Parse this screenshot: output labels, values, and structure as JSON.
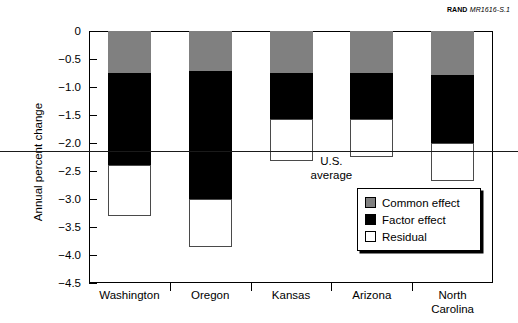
{
  "source_id": {
    "org": "RAND",
    "document": "MR1616-S.1"
  },
  "chart_data": {
    "type": "bar",
    "subtype": "stacked-bar-negative",
    "title": "",
    "xlabel": "",
    "ylabel": "Annual percent change",
    "ylim": [
      -4.5,
      0
    ],
    "ytick_step": 0.5,
    "grid": false,
    "legend_position": "inside-lower-right",
    "categories": [
      "Washington",
      "Oregon",
      "Kansas",
      "Arizona",
      "North\nCarolina"
    ],
    "series": [
      {
        "name": "Common effect",
        "color": "#808080",
        "values": [
          -0.75,
          -0.72,
          -0.75,
          -0.75,
          -0.78
        ]
      },
      {
        "name": "Factor effect",
        "color": "#000000",
        "values": [
          -1.65,
          -2.28,
          -0.82,
          -0.82,
          -1.22
        ]
      },
      {
        "name": "Residual",
        "color": "#ffffff",
        "values": [
          -0.9,
          -0.85,
          -0.76,
          -0.68,
          -0.67
        ]
      }
    ],
    "cumulative_totals": [
      -3.3,
      -3.85,
      -2.33,
      -2.25,
      -2.67
    ],
    "segment_boundaries": {
      "Washington": {
        "common_end": -0.75,
        "factor_end": -2.4,
        "residual_end": -3.3
      },
      "Oregon": {
        "common_end": -0.72,
        "factor_end": -3.0,
        "residual_end": -3.85
      },
      "Kansas": {
        "common_end": -0.75,
        "factor_end": -1.57,
        "residual_end": -2.33
      },
      "Arizona": {
        "common_end": -0.75,
        "factor_end": -1.57,
        "residual_end": -2.25
      },
      "North Carolina": {
        "common_end": -0.78,
        "factor_end": -2.0,
        "residual_end": -2.67
      }
    },
    "ytick_labels": [
      "0",
      "−0.5",
      "−1.0",
      "−1.5",
      "−2.0",
      "−2.5",
      "−3.0",
      "−3.5",
      "−4.0",
      "−4.5"
    ],
    "ytick_values": [
      0,
      -0.5,
      -1.0,
      -1.5,
      -2.0,
      -2.5,
      -3.0,
      -3.5,
      -4.0,
      -4.5
    ],
    "reference_line": {
      "label": "U.S.\naverage",
      "value": -2.15,
      "color": "#1a1a1a"
    },
    "legend_entries": [
      {
        "label": "Common effect",
        "color": "#808080"
      },
      {
        "label": "Factor effect",
        "color": "#000000"
      },
      {
        "label": "Residual",
        "color": "#ffffff"
      }
    ]
  }
}
